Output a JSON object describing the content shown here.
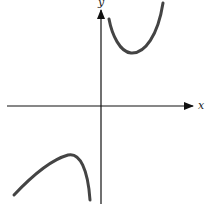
{
  "diagram": {
    "type": "function-graph",
    "axes": {
      "x_label": "x",
      "y_label": "y"
    },
    "curves": [
      {
        "name": "upper-branch",
        "description": "U-shaped branch in quadrant I with local minimum"
      },
      {
        "name": "lower-branch",
        "description": "inverted-U branch in quadrant III with local maximum"
      }
    ],
    "colors": {
      "axis": "#111111",
      "curve": "#444444"
    }
  }
}
